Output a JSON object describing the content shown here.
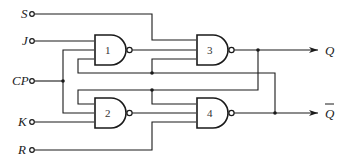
{
  "diagram": {
    "title": "",
    "inputs": [
      {
        "id": "S",
        "label": "S"
      },
      {
        "id": "J",
        "label": "J"
      },
      {
        "id": "CP",
        "label": "CP"
      },
      {
        "id": "K",
        "label": "K"
      },
      {
        "id": "R",
        "label": "R"
      }
    ],
    "outputs": [
      {
        "id": "Q",
        "label": "Q"
      },
      {
        "id": "Qbar",
        "label": "Q"
      }
    ],
    "gates": [
      {
        "id": "g1",
        "type": "NAND",
        "label": "1"
      },
      {
        "id": "g2",
        "type": "NAND",
        "label": "2"
      },
      {
        "id": "g3",
        "type": "NAND",
        "label": "3"
      },
      {
        "id": "g4",
        "type": "NAND",
        "label": "4"
      }
    ],
    "colors": {
      "line": "#1a1a1a",
      "background": "#ffffff"
    }
  }
}
